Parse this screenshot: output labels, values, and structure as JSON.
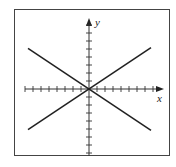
{
  "figure": {
    "frame": true,
    "axes": {
      "x_label": "x",
      "y_label": "y",
      "tick_spacing_px": 8,
      "x_ticks_left": 8,
      "x_ticks_right": 8,
      "y_ticks_up": 8,
      "y_ticks_down": 8,
      "arrows": [
        "positive-x",
        "positive-y"
      ]
    },
    "lines": [
      {
        "name": "line-positive-slope",
        "equation": "y = (2/3)x",
        "slope": 0.6667,
        "intercept": 0
      },
      {
        "name": "line-negative-slope",
        "equation": "y = -(2/3)x",
        "slope": -0.6667,
        "intercept": 0
      }
    ],
    "colors": {
      "line": "#222222",
      "axis": "#333333",
      "frame": "#444444",
      "background": "#ffffff"
    }
  }
}
